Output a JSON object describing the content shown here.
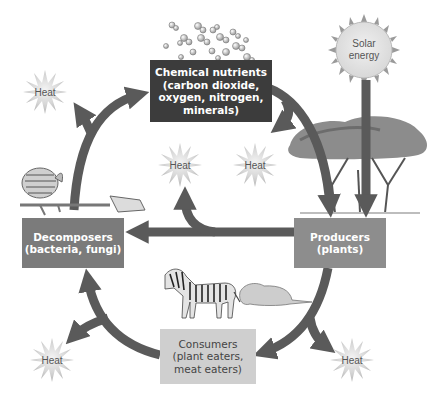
{
  "diagram": {
    "title": "",
    "nodes": {
      "chemical_nutrients": {
        "label": "Chemical nutrients\n(carbon dioxide,\noxygen, nitrogen,\nminerals)",
        "fill": "#3c3c3c"
      },
      "decomposers": {
        "label": "Decomposers\n(bacteria, fungi)",
        "fill": "#7b7b7b"
      },
      "producers": {
        "label": "Producers\n(plants)",
        "fill": "#8d8d8d"
      },
      "consumers": {
        "label": "Consumers\n(plant eaters,\nmeat eaters)",
        "fill": "#cfcfcf"
      }
    },
    "sun": {
      "label": "Solar\nenergy"
    },
    "heat": [
      {
        "label": "Heat",
        "x": 45,
        "y": 92
      },
      {
        "label": "Heat",
        "x": 180,
        "y": 165
      },
      {
        "label": "Heat",
        "x": 255,
        "y": 165
      },
      {
        "label": "Heat",
        "x": 52,
        "y": 360
      },
      {
        "label": "Heat",
        "x": 352,
        "y": 360
      }
    ],
    "arrow_color": "#5a5a5a",
    "edges": [
      {
        "from": "chemical_nutrients",
        "to": "producers"
      },
      {
        "from": "sun",
        "to": "producers"
      },
      {
        "from": "producers",
        "to": "decomposers"
      },
      {
        "from": "producers",
        "to": "consumers"
      },
      {
        "from": "consumers",
        "to": "decomposers"
      },
      {
        "from": "decomposers",
        "to": "chemical_nutrients"
      },
      {
        "from": "chemical_nutrients",
        "to": "heat"
      },
      {
        "from": "producers",
        "to": "heat"
      },
      {
        "from": "consumers",
        "to": "heat"
      },
      {
        "from": "decomposers",
        "to": "heat"
      }
    ],
    "illustrations": [
      "molecules",
      "sun",
      "acacia-trees",
      "skeleton",
      "zebra",
      "lion"
    ]
  }
}
